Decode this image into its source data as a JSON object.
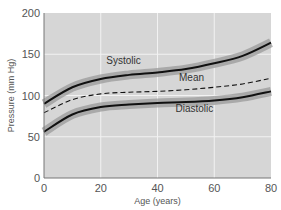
{
  "chart_data": {
    "type": "line",
    "title": "",
    "xlabel": "Age (years)",
    "ylabel": "Pressure (mm Hg)",
    "xlim": [
      0,
      80
    ],
    "ylim": [
      0,
      200
    ],
    "xticks": [
      0,
      20,
      40,
      60,
      80
    ],
    "yticks": [
      0,
      50,
      100,
      150,
      200
    ],
    "grid": true,
    "x": [
      0,
      10,
      20,
      30,
      40,
      50,
      60,
      70,
      80
    ],
    "series": [
      {
        "name": "Systolic",
        "style": "solid with shaded band",
        "values": [
          90,
          110,
          120,
          125,
          128,
          132,
          139,
          148,
          164
        ]
      },
      {
        "name": "Mean",
        "style": "dashed",
        "values": [
          79,
          95,
          102,
          104,
          105,
          107,
          110,
          114,
          121
        ]
      },
      {
        "name": "Diastolic",
        "style": "solid with shaded band",
        "values": [
          56,
          77,
          86,
          89,
          91,
          92,
          94,
          98,
          105
        ]
      }
    ],
    "annotations": [
      {
        "text": "Systolic",
        "x": 28,
        "y": 138
      },
      {
        "text": "Mean",
        "x": 52,
        "y": 117
      },
      {
        "text": "Diastolic",
        "x": 53,
        "y": 80
      }
    ],
    "colors": {
      "plot_background": "#d6d6d6",
      "grid": "#f2f2f2",
      "band": "#9a9a9a",
      "line": "#111111"
    }
  }
}
